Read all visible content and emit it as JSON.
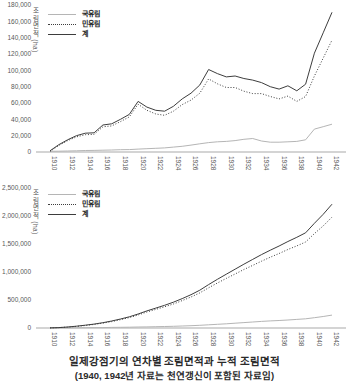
{
  "caption": {
    "title": "일제강점기의 연차별 조림면적과 누적 조림면적",
    "note": "(1940, 1942년 자료는 천연갱신이 포함된 자료임)"
  },
  "colors": {
    "dark": "#3d3d3d",
    "light": "#b5b5b5",
    "axis": "#c6c6c6",
    "tick": "#595959"
  },
  "chart_data": [
    {
      "type": "line",
      "ylabel": "조림면적 (ha)",
      "legend": [
        "국유림",
        "민유림",
        "계"
      ],
      "legend_position": "top-left",
      "grid": false,
      "x_start": 1910,
      "x_step_years": 1,
      "x_ticks": [
        1910,
        1912,
        1914,
        1916,
        1918,
        1920,
        1922,
        1924,
        1926,
        1928,
        1930,
        1932,
        1934,
        1936,
        1938,
        1940,
        1942
      ],
      "ylim": [
        0,
        180000
      ],
      "y_ticks": [
        0,
        20000,
        40000,
        60000,
        80000,
        100000,
        120000,
        140000,
        160000,
        180000
      ],
      "series": [
        {
          "name": "국유림",
          "key": "national-forest",
          "color": "light",
          "dash": "solid",
          "values": [
            800,
            1000,
            1200,
            1500,
            1800,
            2000,
            2200,
            2500,
            2800,
            3000,
            3500,
            4000,
            4500,
            5000,
            6000,
            7000,
            8500,
            10000,
            11500,
            12500,
            13000,
            14000,
            15500,
            16500,
            13500,
            12000,
            12000,
            12500,
            13000,
            15000,
            28000,
            31000,
            34000
          ]
        },
        {
          "name": "민유림",
          "key": "private-forest",
          "color": "dark",
          "dash": "dotted",
          "values": [
            700,
            8000,
            13800,
            18500,
            21200,
            21500,
            30800,
            32000,
            37200,
            43000,
            58500,
            51000,
            46500,
            45000,
            50000,
            58000,
            63500,
            72000,
            89500,
            83500,
            79000,
            79000,
            74500,
            71500,
            71500,
            68000,
            65000,
            68500,
            62000,
            68000,
            93000,
            115000,
            137000
          ]
        },
        {
          "name": "계",
          "key": "total",
          "color": "dark",
          "dash": "solid",
          "values": [
            1500,
            9000,
            15000,
            20000,
            23000,
            23500,
            33000,
            34500,
            40000,
            46000,
            62000,
            55000,
            51000,
            50000,
            56000,
            65000,
            72000,
            82000,
            101000,
            96000,
            92000,
            93000,
            90000,
            88000,
            85000,
            80000,
            77000,
            81000,
            75000,
            83000,
            121000,
            146000,
            171000
          ]
        }
      ]
    },
    {
      "type": "line",
      "ylabel": "조림면적 (ha)",
      "legend": [
        "국유림",
        "민유림",
        "계"
      ],
      "legend_position": "top-left",
      "grid": false,
      "x_start": 1910,
      "x_step_years": 1,
      "x_ticks": [
        1910,
        1912,
        1914,
        1916,
        1918,
        1920,
        1922,
        1924,
        1926,
        1928,
        1930,
        1932,
        1934,
        1936,
        1938,
        1940,
        1942
      ],
      "ylim": [
        0,
        2500000
      ],
      "y_ticks": [
        0,
        500000,
        1000000,
        1500000,
        2000000,
        2500000
      ],
      "series": [
        {
          "name": "국유림",
          "key": "national-forest",
          "color": "light",
          "dash": "solid",
          "values": [
            700,
            1400,
            2100,
            3600,
            5000,
            6400,
            8000,
            10000,
            12000,
            14300,
            17200,
            20000,
            23000,
            26500,
            30700,
            35700,
            41500,
            48600,
            56500,
            65800,
            75100,
            85100,
            95800,
            108000,
            117300,
            125900,
            134500,
            143700,
            153100,
            163800,
            183800,
            205900,
            230200
          ]
        },
        {
          "name": "민유림",
          "key": "private-forest",
          "color": "dark",
          "dash": "dotted",
          "values": [
            1300,
            6600,
            15900,
            28400,
            45000,
            63600,
            87000,
            115000,
            148000,
            185700,
            232800,
            285000,
            332000,
            378500,
            429300,
            489300,
            553500,
            626400,
            718500,
            804200,
            884900,
            964900,
            1044200,
            1117000,
            1192700,
            1264100,
            1330500,
            1401300,
            1466900,
            1536200,
            1686200,
            1824100,
            1979800
          ]
        },
        {
          "name": "계",
          "key": "total",
          "color": "dark",
          "dash": "solid",
          "values": [
            2000,
            8000,
            18000,
            32000,
            50000,
            70000,
            95000,
            125000,
            160000,
            200000,
            250000,
            305000,
            355000,
            405000,
            460000,
            525000,
            595000,
            675000,
            775000,
            870000,
            960000,
            1050000,
            1140000,
            1225000,
            1310000,
            1390000,
            1465000,
            1545000,
            1620000,
            1700000,
            1870000,
            2030000,
            2210000
          ]
        }
      ]
    }
  ]
}
